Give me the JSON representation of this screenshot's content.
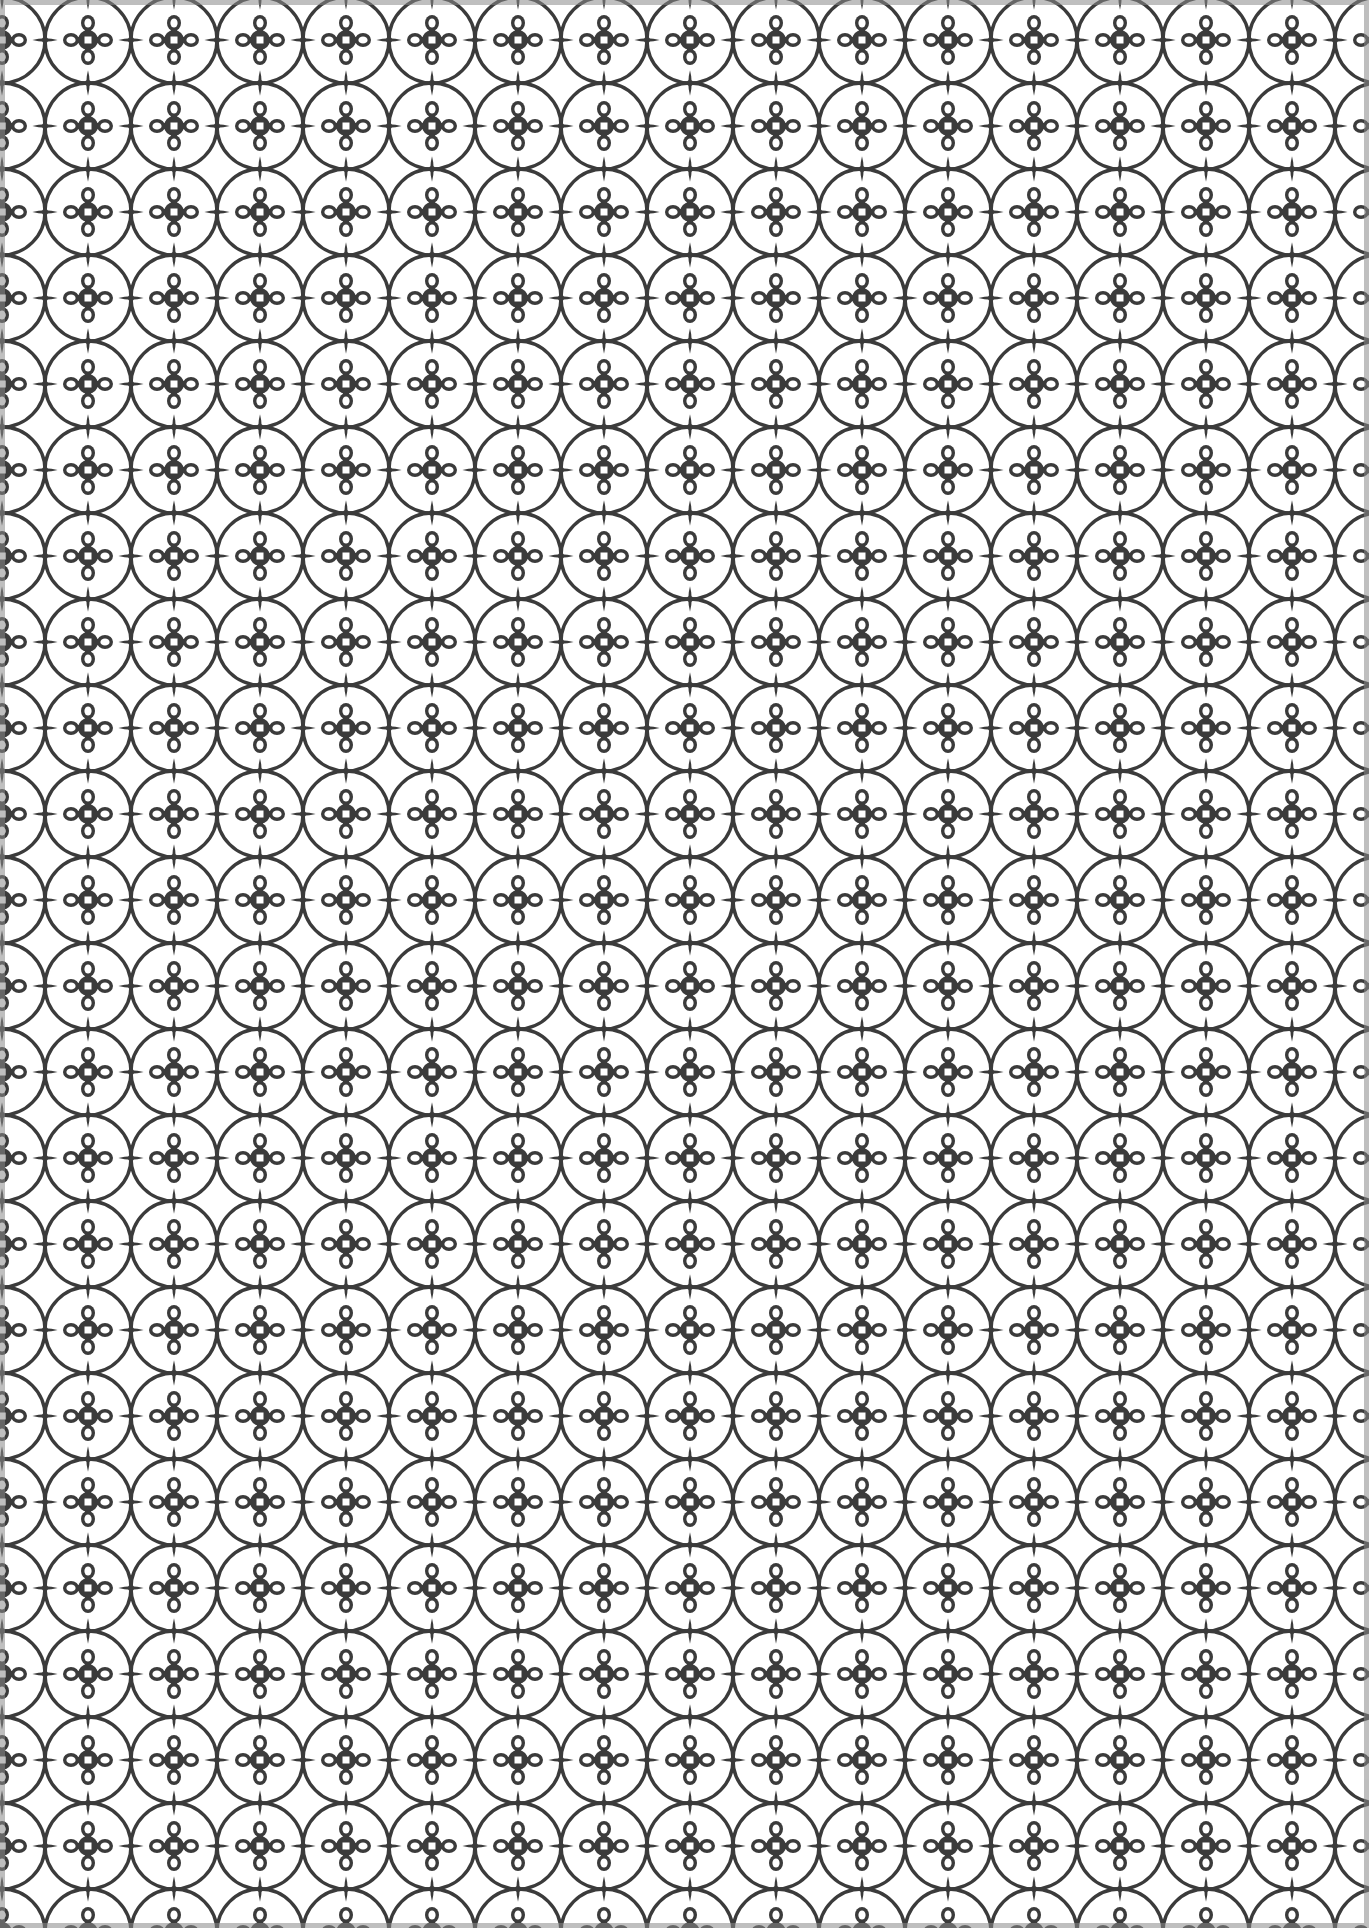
{
  "image": {
    "description": "Seamless monochrome geometric lattice pattern of interlocking circles forming four-petal lens rosettes with small square-and-dot cross motifs",
    "motifs": [
      "four-petal-rosette",
      "square-cross-motif"
    ],
    "colors": {
      "ink": "#3a3a3a",
      "paper": "#ffffff"
    }
  }
}
